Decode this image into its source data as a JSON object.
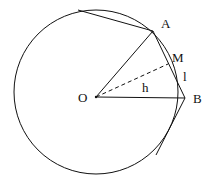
{
  "diagram": {
    "type": "geometry",
    "labels": {
      "O": "O",
      "A": "A",
      "B": "B",
      "M": "M",
      "h": "h",
      "l": "l"
    },
    "colors": {
      "stroke": "#111111",
      "background": "#ffffff"
    }
  }
}
